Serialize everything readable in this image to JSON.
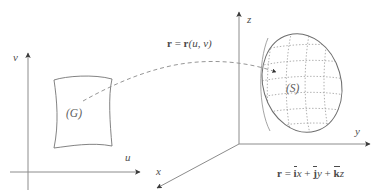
{
  "figure": {
    "background_color": "#ffffff",
    "stroke_color": "#707070",
    "label_color": "#5a5a5a",
    "width": 382,
    "height": 192
  },
  "uv_plane": {
    "v_axis_label": "v",
    "u_axis_label": "u",
    "region_label": "(G)"
  },
  "xyz_space": {
    "z_axis_label": "z",
    "y_axis_label": "y",
    "x_axis_label": "x",
    "surface_label": "(S)"
  },
  "mapping": {
    "lhs": "r",
    "equals": "=",
    "rhs_fn": "r",
    "rhs_args": "(u, v)"
  },
  "position_vector": {
    "lhs": "r",
    "equals": "=",
    "i": "i",
    "x": "x",
    "plus1": "+",
    "j": "j",
    "y": "y",
    "plus2": "+",
    "k": "k",
    "z": "z"
  }
}
